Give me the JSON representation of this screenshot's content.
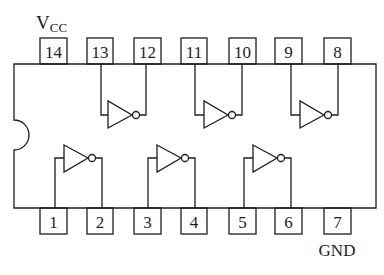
{
  "labels": {
    "vcc_main": "V",
    "vcc_sub": "CC",
    "gnd": "GND"
  },
  "top_pins": [
    {
      "number": "14",
      "x": 40
    },
    {
      "number": "13",
      "x": 87
    },
    {
      "number": "12",
      "x": 134
    },
    {
      "number": "11",
      "x": 181
    },
    {
      "number": "10",
      "x": 229
    },
    {
      "number": "9",
      "x": 275
    },
    {
      "number": "8",
      "x": 324
    }
  ],
  "bottom_pins": [
    {
      "number": "1",
      "x": 40
    },
    {
      "number": "2",
      "x": 87
    },
    {
      "number": "3",
      "x": 134
    },
    {
      "number": "4",
      "x": 181
    },
    {
      "number": "5",
      "x": 229
    },
    {
      "number": "6",
      "x": 275
    },
    {
      "number": "7",
      "x": 324
    }
  ],
  "gates": [
    {
      "name": "inverter",
      "input_pin": "1",
      "output_pin": "2",
      "row": "bottom"
    },
    {
      "name": "inverter",
      "input_pin": "3",
      "output_pin": "4",
      "row": "bottom"
    },
    {
      "name": "inverter",
      "input_pin": "5",
      "output_pin": "6",
      "row": "bottom"
    },
    {
      "name": "inverter",
      "input_pin": "13",
      "output_pin": "12",
      "row": "top"
    },
    {
      "name": "inverter",
      "input_pin": "11",
      "output_pin": "10",
      "row": "top"
    },
    {
      "name": "inverter",
      "input_pin": "9",
      "output_pin": "8",
      "row": "top"
    }
  ],
  "colors": {
    "line": "#1e1e1e",
    "background": "#ffffff"
  }
}
